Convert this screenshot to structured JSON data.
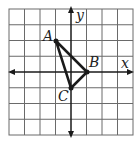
{
  "graph": {
    "grid": {
      "cols": 8,
      "rows": 8,
      "x_min": -4,
      "x_max": 4,
      "y_min": -4,
      "y_max": 4
    },
    "axes": {
      "x_label": "x",
      "y_label": "y"
    },
    "points": [
      {
        "name": "A",
        "x": -1,
        "y": 2
      },
      {
        "name": "B",
        "x": 1,
        "y": 0
      },
      {
        "name": "C",
        "x": 0,
        "y": -1
      }
    ],
    "shape": "triangle ABC",
    "colors": {
      "grid": "#555555",
      "lines": "#1a1a1a"
    }
  }
}
